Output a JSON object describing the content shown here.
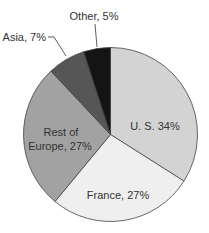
{
  "chart_data": {
    "type": "pie",
    "title": "",
    "categories": [
      "U. S.",
      "France",
      "Rest of Europe",
      "Asia",
      "Other"
    ],
    "values": [
      34,
      27,
      27,
      7,
      5
    ],
    "unit": "%",
    "start_angle_deg": 0,
    "direction": "clockwise",
    "colors": [
      "#d3d3d3",
      "#efefef",
      "#a2a2a2",
      "#565656",
      "#141414"
    ],
    "labels": [
      {
        "category": "U. S.",
        "lines": [
          "U. S. 34%"
        ],
        "placement": "inside"
      },
      {
        "category": "France",
        "lines": [
          "France, 27%"
        ],
        "placement": "inside"
      },
      {
        "category": "Rest of Europe",
        "lines": [
          "Rest of",
          "Europe, 27%"
        ],
        "placement": "inside"
      },
      {
        "category": "Asia",
        "lines": [
          "Asia, 7%"
        ],
        "placement": "outside-leader"
      },
      {
        "category": "Other",
        "lines": [
          "Other, 5%"
        ],
        "placement": "outside-leader"
      }
    ],
    "legend": "none"
  },
  "geometry": {
    "cx": 110.5,
    "cy": 134.5,
    "r": 87
  },
  "labels": {
    "us": "U. S. 34%",
    "france": "France, 27%",
    "rest_line1": "Rest of",
    "rest_line2": "Europe, 27%",
    "asia": "Asia, 7%",
    "other": "Other, 5%"
  }
}
